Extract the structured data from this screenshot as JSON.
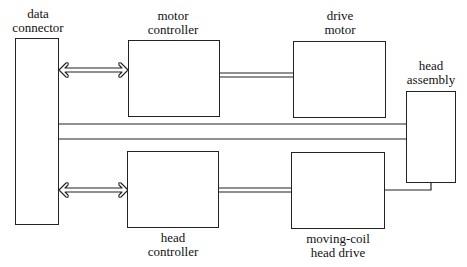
{
  "diagram": {
    "type": "block-diagram",
    "colors": {
      "stroke": "#222222",
      "background": "#ffffff"
    },
    "blocks": [
      {
        "id": "data_connector",
        "label_lines": [
          "data",
          "connector"
        ]
      },
      {
        "id": "motor_controller",
        "label_lines": [
          "motor",
          "controller"
        ]
      },
      {
        "id": "drive_motor",
        "label_lines": [
          "drive",
          "motor"
        ]
      },
      {
        "id": "head_assembly",
        "label_lines": [
          "head",
          "assembly"
        ]
      },
      {
        "id": "head_controller",
        "label_lines": [
          "head",
          "controller"
        ]
      },
      {
        "id": "moving_coil_head_drive",
        "label_lines": [
          "moving-coil",
          "head drive"
        ]
      }
    ],
    "connections": [
      {
        "from": "data_connector",
        "to": "motor_controller",
        "style": "bidirectional-hollow-arrow"
      },
      {
        "from": "data_connector",
        "to": "head_controller",
        "style": "bidirectional-hollow-arrow"
      },
      {
        "from": "motor_controller",
        "to": "drive_motor",
        "style": "double-line"
      },
      {
        "from": "head_controller",
        "to": "moving_coil_head_drive",
        "style": "double-line"
      },
      {
        "from": "data_connector",
        "to": "head_assembly",
        "style": "wide-bus"
      },
      {
        "from": "moving_coil_head_drive",
        "to": "head_assembly",
        "style": "single-line-elbow"
      }
    ]
  }
}
